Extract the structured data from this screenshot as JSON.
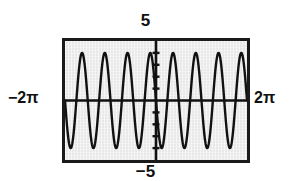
{
  "figure": {
    "kind": "graphing-calculator-screen",
    "frame_color": "#1a1a1a",
    "screen_color": "#e8e8e8",
    "curve_color": "#111111"
  },
  "labels": {
    "y_max": "5",
    "y_min": "−5",
    "x_min": "−2π",
    "x_max": "2π"
  },
  "chart_data": {
    "type": "line",
    "title": "",
    "xlabel": "",
    "ylabel": "",
    "xlim": [
      -6.283185307,
      6.283185307
    ],
    "ylim": [
      -5,
      5
    ],
    "xtick_labels": [
      "−2π",
      "2π"
    ],
    "ytick_labels": [
      "5",
      "−5"
    ],
    "grid": false,
    "legend": null,
    "y_axis_ticks": [
      -4,
      -3,
      -2,
      -1,
      1,
      2,
      3,
      4
    ],
    "x_axis_ticks": [],
    "series": [
      {
        "name": "y = -4 sin(4x)",
        "amplitude": 4,
        "frequency": 4,
        "period": 0.785398163,
        "phase": 3.141592653,
        "cycles_visible": 4,
        "zero_crossings": [
          -6.283185307,
          -5.497787144,
          -4.71238898,
          -3.926990817,
          -3.141592653,
          -2.35619449,
          -1.570796327,
          -0.785398163,
          0,
          0.785398163,
          1.570796327,
          2.35619449,
          3.141592653,
          3.926990817,
          4.71238898,
          5.497787144,
          6.283185307
        ],
        "maxima_x": [
          -5.890486225,
          -4.319689899,
          -2.748893572,
          -1.178097245,
          0.392699082,
          1.963495408,
          3.534291735,
          5.105088062
        ],
        "maxima_y": 4,
        "minima_x": [
          -5.105088062,
          -3.534291735,
          -1.963495408,
          -0.392699082,
          1.178097245,
          2.748893572,
          4.319689899,
          5.890486225
        ],
        "minima_y": -4
      }
    ]
  }
}
